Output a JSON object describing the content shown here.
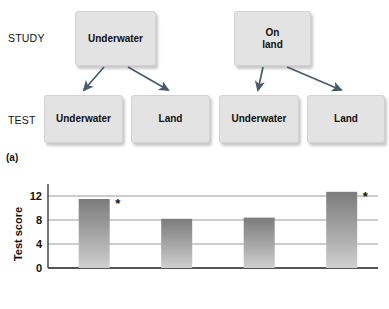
{
  "figure": {
    "panel_a_caption": "(a)",
    "panel_b_caption": "(b)"
  },
  "diagram": {
    "row_labels": {
      "study": "STUDY",
      "test": "TEST"
    },
    "study_nodes": [
      {
        "id": "study-underwater",
        "label": "Underwater"
      },
      {
        "id": "study-on-land",
        "label": "On\nland"
      }
    ],
    "test_nodes": [
      {
        "id": "test-underwater-1",
        "label": "Underwater"
      },
      {
        "id": "test-land-1",
        "label": "Land"
      },
      {
        "id": "test-underwater-2",
        "label": "Underwater"
      },
      {
        "id": "test-land-2",
        "label": "Land"
      }
    ],
    "colors": {
      "box_fill": "#e3e3e3",
      "box_border": "#d2d2d2",
      "arrow": "#4a5a6b"
    }
  },
  "chart_data": {
    "type": "bar",
    "title": "",
    "xlabel": "",
    "ylabel": "Test score",
    "ylim": [
      0,
      14
    ],
    "yticks": [
      0,
      4,
      8,
      12
    ],
    "ytick_labels": [
      "0",
      "4",
      "8",
      "12"
    ],
    "grid": true,
    "grid_axis": "y",
    "legend": null,
    "categories": [
      "Study underwater / Test underwater",
      "Study underwater / Test land",
      "Study on land / Test underwater",
      "Study on land / Test land"
    ],
    "values": [
      11.5,
      8.2,
      8.4,
      12.7
    ],
    "annotations": [
      {
        "bar_index": 0,
        "text": "*"
      },
      {
        "bar_index": 3,
        "text": "*"
      }
    ],
    "bar_gradient": {
      "top": "#808080",
      "bottom": "#c9c9c9"
    },
    "axis_color": "#555555",
    "grid_color": "#9a9a9a"
  }
}
